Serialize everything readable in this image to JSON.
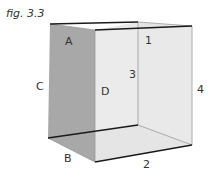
{
  "figure": {
    "title": "fig. 3.3",
    "labels": {
      "A": "A",
      "B": "B",
      "C": "C",
      "D": "D",
      "one": "1",
      "two": "2",
      "three": "3",
      "four": "4"
    },
    "colors": {
      "left_face": "#a8a8a8",
      "inner_faces": "#e6e6e6",
      "floor": "#dcdcdc",
      "edge": "#1a1a1a",
      "thin_edge": "#9a9a9a"
    }
  }
}
